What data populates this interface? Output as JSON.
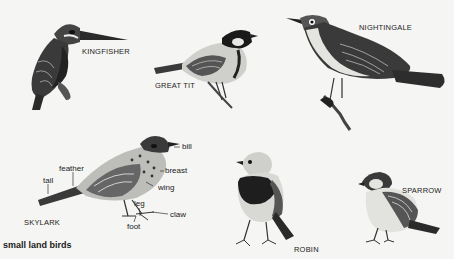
{
  "title": "small land birds",
  "birds": [
    {
      "name": "KINGFISHER"
    },
    {
      "name": "GREAT TIT"
    },
    {
      "name": "NIGHTINGALE"
    },
    {
      "name": "SKYLARK"
    },
    {
      "name": "ROBIN"
    },
    {
      "name": "SPARROW"
    }
  ],
  "skylark_parts": {
    "bill": "bill",
    "breast": "breast",
    "wing": "wing",
    "feather": "feather",
    "tail": "tail",
    "leg": "leg",
    "claw": "claw",
    "foot": "foot"
  },
  "colors": {
    "ink": "#1c1c1c",
    "paper": "#f5f5f3"
  }
}
